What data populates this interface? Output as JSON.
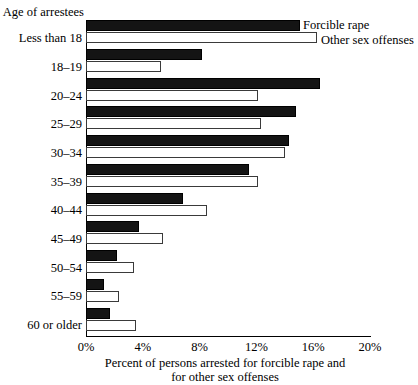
{
  "chart_data": {
    "type": "bar",
    "orientation": "horizontal",
    "title": "",
    "xlabel": "Percent of persons arrested for forcible rape and for other sex offenses",
    "xlabel_lines": [
      "Percent of persons arrested for forcible rape and",
      "for other sex offenses"
    ],
    "ylabel": "Age of arrestees",
    "categories": [
      "Less than 18",
      "18–19",
      "20–24",
      "25–29",
      "30–34",
      "35–39",
      "40–44",
      "45–49",
      "50–54",
      "55–59",
      "60 or older"
    ],
    "series": [
      {
        "name": "Forcible rape",
        "color": "#141414",
        "values": [
          15.1,
          8.2,
          16.5,
          14.8,
          14.3,
          11.5,
          6.8,
          3.7,
          2.2,
          1.3,
          1.7
        ]
      },
      {
        "name": "Other sex offenses",
        "color": "#ffffff",
        "values": [
          16.3,
          5.3,
          12.1,
          12.3,
          14.0,
          12.1,
          8.5,
          5.4,
          3.4,
          2.3,
          3.5
        ]
      }
    ],
    "xlim": [
      0,
      20
    ],
    "xticks": [
      0,
      4,
      8,
      12,
      16,
      20
    ],
    "xtick_labels": [
      "0%",
      "4%",
      "8%",
      "12%",
      "16%",
      "20%"
    ],
    "grid": false,
    "legend_position": "top-right"
  },
  "legend": {
    "forcible_label": "Forcible rape",
    "other_label": "Other sex offenses"
  }
}
